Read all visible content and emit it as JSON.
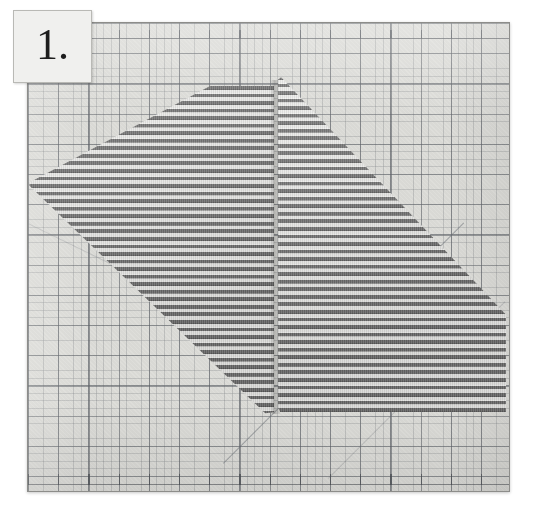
{
  "image": {
    "kind": "instructional-photograph",
    "caption": "Striped fabric cut into two pieces laid on a green self-healing cutting mat",
    "width": 537,
    "height": 516,
    "background_color": "#ffffff"
  },
  "step_label": {
    "text": "1.",
    "number": "1",
    "box_color": "#f0f0ee",
    "text_color": "#1d1d1d",
    "border_color": "#b9b9b5"
  },
  "mat": {
    "name": "cutting-mat",
    "surface_color": "#dededa",
    "grid_line_color": "#5c6066",
    "fine_grid_line_color": "#787c80",
    "border_color": "#8d8d8a",
    "major_grid_spacing_px": 30,
    "fine_grid_spacing_px": 7.5,
    "has_ruler_ticks": true,
    "has_45_degree_guides": true
  },
  "fabric": {
    "pattern": "horizontal-stripes",
    "dark_stripe_color": "#6e6e6e",
    "light_stripe_color": "#e9e9e7",
    "stripe_period_px": 7.5,
    "pieces": [
      {
        "name": "left-piece",
        "shape": "triangle-parallelogram",
        "cut_edge": "lower-left-45-degree-bias",
        "top_edge": "straight-horizontal"
      },
      {
        "name": "right-piece",
        "shape": "triangle-parallelogram",
        "cut_edge": "upper-left-45-degree-bias",
        "bottom_edge": "straight-horizontal"
      }
    ],
    "cut_line": "vertical-center-seam"
  }
}
